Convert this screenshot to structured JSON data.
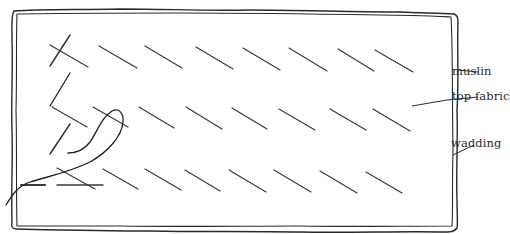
{
  "diagram": {
    "labels": {
      "muslin": "muslin",
      "top_fabric": "top fabric",
      "wadding": "wadding"
    },
    "colors": {
      "line": "#2a2a2a",
      "stitch": "#3a3a3a",
      "background": "#ffffff"
    },
    "stitch_rows": [
      {
        "row": 1,
        "stitches": [
          [
            50,
            45,
            88,
            67
          ],
          [
            99,
            45,
            137,
            68
          ],
          [
            145,
            47,
            182,
            69
          ],
          [
            196,
            47,
            233,
            69
          ],
          [
            243,
            48,
            278,
            70
          ],
          [
            289,
            49,
            327,
            71
          ],
          [
            338,
            50,
            374,
            71
          ],
          [
            375,
            50,
            413,
            72
          ]
        ]
      },
      {
        "row": 2,
        "stitches": [
          [
            52,
            107,
            87,
            127
          ],
          [
            93,
            106,
            128,
            127
          ],
          [
            139,
            108,
            174,
            129
          ],
          [
            188,
            108,
            222,
            129
          ],
          [
            232,
            109,
            265,
            129
          ],
          [
            279,
            110,
            315,
            130
          ],
          [
            330,
            109,
            358,
            126
          ],
          [
            373,
            108,
            410,
            130
          ]
        ]
      },
      {
        "row": 3,
        "stitches": [
          [
            56,
            167,
            95,
            190
          ],
          [
            103,
            168,
            138,
            189
          ],
          [
            145,
            168,
            180,
            189
          ],
          [
            185,
            170,
            219,
            190
          ],
          [
            229,
            170,
            266,
            192
          ],
          [
            274,
            170,
            310,
            191
          ],
          [
            320,
            171,
            356,
            192
          ],
          [
            366,
            172,
            402,
            193
          ]
        ]
      }
    ],
    "extra_strokes": [
      [
        55,
        44,
        70,
        66
      ],
      [
        50,
        105,
        70,
        73
      ],
      [
        43,
        124,
        60,
        150
      ]
    ],
    "needle_thread": "M8,200 C20,185 40,182 70,177 C100,172 120,150 122,128 C124,114 116,108 108,113 C96,122 94,143 68,153"
  }
}
